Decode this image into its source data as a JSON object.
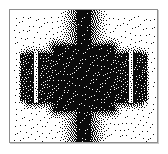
{
  "figure": {
    "caption": "",
    "width": 168,
    "height": 154,
    "background_color": "#ffffff"
  },
  "frame": {
    "name": "image-frame",
    "x": 9,
    "y": 9,
    "width": 149,
    "height": 134,
    "border_color": "#8d8d8d",
    "border_width": 1,
    "shadow_color": "#c9c9c9",
    "fill_color": "#ffffff"
  },
  "chart_data": {
    "type": "heatmap",
    "subtitle": "",
    "xlabel": "",
    "ylabel": "",
    "legend": [],
    "grid": false,
    "rendering": "1-bit error-diffusion dither, black on white",
    "ink_color": "#000000",
    "paper_color": "#ffffff",
    "plot_area": {
      "x": 10,
      "y": 10,
      "width": 147,
      "height": 132
    },
    "xlim": [
      0,
      147
    ],
    "ylim": [
      0,
      132
    ],
    "regions": [
      {
        "name": "vertical-stripe-core",
        "shape": "rect",
        "x": 74,
        "y": 0,
        "width": 13,
        "height": 132,
        "density": 0.97
      },
      {
        "name": "vertical-stripe-halo",
        "shape": "rect",
        "x": 62,
        "y": 0,
        "width": 37,
        "height": 132,
        "density": 0.72
      },
      {
        "name": "horizontal-body-band",
        "shape": "rect",
        "x": 17,
        "y": 39,
        "width": 114,
        "height": 58,
        "density": 0.9
      },
      {
        "name": "central-block",
        "shape": "rect",
        "x": 38,
        "y": 30,
        "width": 71,
        "height": 76,
        "density": 0.95
      },
      {
        "name": "left-detached-block",
        "shape": "rect",
        "x": 10,
        "y": 41,
        "width": 14,
        "height": 52,
        "density": 0.86
      },
      {
        "name": "right-detached-block",
        "shape": "rect",
        "x": 123,
        "y": 41,
        "width": 14,
        "height": 52,
        "density": 0.86
      },
      {
        "name": "left-gap",
        "shape": "rect",
        "x": 24,
        "y": 41,
        "width": 4,
        "height": 52,
        "density": 0.06
      },
      {
        "name": "right-gap",
        "shape": "rect",
        "x": 119,
        "y": 41,
        "width": 4,
        "height": 52,
        "density": 0.06
      },
      {
        "name": "corner-quadrant-speckle",
        "shape": "corners",
        "density": 0.03
      }
    ],
    "axis_visible": false,
    "tick_labels_x": [],
    "tick_labels_y": []
  }
}
